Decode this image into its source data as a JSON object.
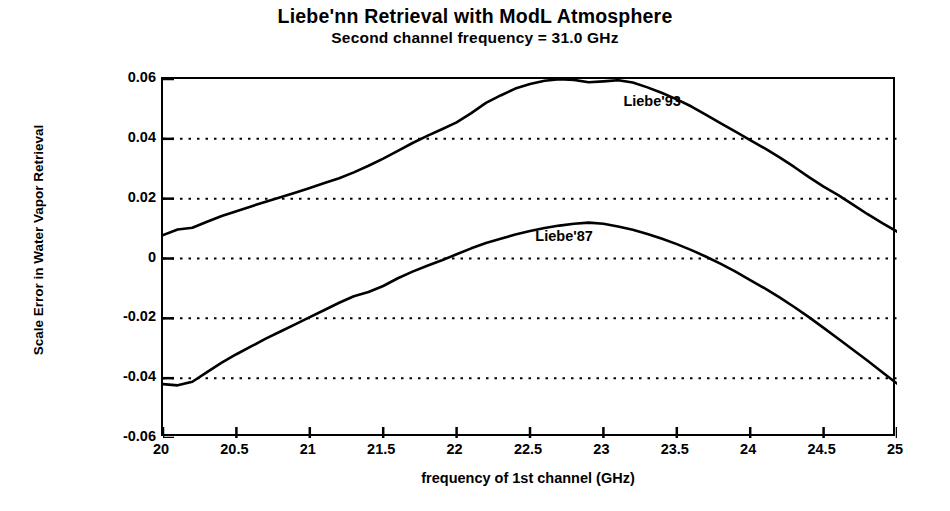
{
  "chart_data": {
    "type": "line",
    "title": "Liebe'nn Retrieval with ModL Atmosphere",
    "subtitle": "Second channel frequency = 31.0 GHz",
    "xlabel": "frequency of 1st channel (GHz)",
    "ylabel": "Scale Error in Water Vapor Retrieval",
    "xlim": [
      20,
      25
    ],
    "ylim": [
      -0.06,
      0.06
    ],
    "grid": "horizontal-dotted",
    "legend": "inline-annotations",
    "xticks": [
      "20",
      "20.5",
      "21",
      "21.5",
      "22",
      "22.5",
      "23",
      "23.5",
      "24",
      "24.5",
      "25"
    ],
    "xtick_values": [
      20,
      20.5,
      21,
      21.5,
      22,
      22.5,
      23,
      23.5,
      24,
      24.5,
      25
    ],
    "yticks": [
      "0.06",
      "0.04",
      "0.02",
      "0",
      "-0.02",
      "-0.04",
      "-0.06"
    ],
    "ytick_values": [
      0.06,
      0.04,
      0.02,
      0,
      -0.02,
      -0.04,
      -0.06
    ],
    "gridline_values": [
      0.04,
      0.02,
      0,
      -0.02,
      -0.04
    ],
    "line_color": "#000000",
    "x": [
      20.0,
      20.1,
      20.2,
      20.3,
      20.4,
      20.5,
      20.6,
      20.7,
      20.8,
      20.9,
      21.0,
      21.1,
      21.2,
      21.3,
      21.4,
      21.5,
      21.6,
      21.7,
      21.8,
      21.9,
      22.0,
      22.1,
      22.2,
      22.3,
      22.4,
      22.5,
      22.6,
      22.7,
      22.8,
      22.9,
      23.0,
      23.1,
      23.2,
      23.3,
      23.4,
      23.5,
      23.6,
      23.7,
      23.8,
      23.9,
      24.0,
      24.1,
      24.2,
      24.3,
      24.4,
      24.5,
      24.6,
      24.7,
      24.8,
      24.9,
      25.0
    ],
    "series": [
      {
        "name": "Liebe'93",
        "label": "Liebe'93",
        "label_x": 23.15,
        "label_y": 0.0515,
        "values": [
          0.0078,
          0.0097,
          0.0103,
          0.0123,
          0.0142,
          0.0158,
          0.0174,
          0.019,
          0.0205,
          0.022,
          0.0236,
          0.0252,
          0.0268,
          0.0288,
          0.031,
          0.0334,
          0.036,
          0.0386,
          0.041,
          0.0432,
          0.0455,
          0.0486,
          0.052,
          0.0545,
          0.0568,
          0.0583,
          0.0594,
          0.0599,
          0.0597,
          0.0589,
          0.0592,
          0.0596,
          0.0588,
          0.0572,
          0.0553,
          0.0532,
          0.0508,
          0.048,
          0.0452,
          0.0424,
          0.0396,
          0.0368,
          0.0338,
          0.0306,
          0.0272,
          0.024,
          0.0212,
          0.018,
          0.0148,
          0.0118,
          0.009
        ]
      },
      {
        "name": "Liebe'87",
        "label": "Liebe'87",
        "label_x": 22.55,
        "label_y": 0.0064,
        "values": [
          -0.042,
          -0.0424,
          -0.0412,
          -0.038,
          -0.0348,
          -0.032,
          -0.0294,
          -0.0268,
          -0.0244,
          -0.022,
          -0.0196,
          -0.0172,
          -0.0148,
          -0.0126,
          -0.0112,
          -0.0092,
          -0.0066,
          -0.0044,
          -0.0024,
          -0.0006,
          0.0014,
          0.0034,
          0.0052,
          0.0066,
          0.008,
          0.0092,
          0.0102,
          0.011,
          0.0116,
          0.012,
          0.0116,
          0.0107,
          0.0096,
          0.0082,
          0.0066,
          0.0048,
          0.0028,
          0.0006,
          -0.0018,
          -0.0044,
          -0.0072,
          -0.01,
          -0.013,
          -0.0162,
          -0.0196,
          -0.0232,
          -0.0268,
          -0.0305,
          -0.0342,
          -0.038,
          -0.0418
        ]
      }
    ]
  }
}
